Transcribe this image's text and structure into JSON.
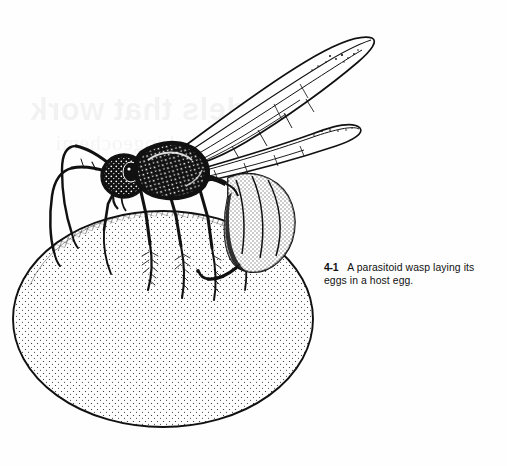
{
  "document": {
    "type": "scanned-book-page",
    "figure_number": "4-1",
    "caption_text": "A parasitoid wasp laying its eggs in a host egg.",
    "caption_full": "4-1   A parasitoid wasp laying its eggs in a host egg.",
    "background_color": "#fefefe",
    "ink_color": "#111111"
  },
  "caption": {
    "number": "4-1",
    "text": "A parasitoid wasp laying its eggs in a host egg."
  },
  "bleed_through": {
    "title": "Models that work",
    "subtitle": "biogeochemi"
  },
  "illustration": {
    "title": "A parasitoid wasp laying its eggs in a host egg",
    "technique": "pen-and-ink stipple and hatch line drawing",
    "subjects": [
      {
        "name": "parasitoid-wasp",
        "parts": [
          "head",
          "antennae",
          "thorax",
          "wings",
          "legs",
          "abdomen",
          "ovipositor"
        ]
      },
      {
        "name": "host-egg",
        "shape": "large oval",
        "shading": "stippled rim"
      }
    ]
  }
}
